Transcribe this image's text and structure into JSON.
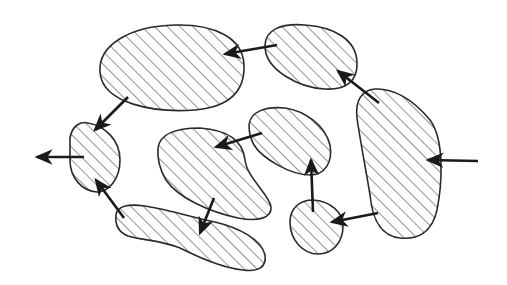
{
  "diagram": {
    "type": "hatched-regions-with-arrows",
    "background": "#ffffff",
    "stroke_color": "#2a2a2a",
    "hatch": {
      "direction": "diagonal-45",
      "spacing": 9,
      "color": "#3a3a3a"
    },
    "regions": [
      {
        "id": "top-left-large",
        "description": "large oval, top-left"
      },
      {
        "id": "top-right-small",
        "description": "small oval, top-right"
      },
      {
        "id": "left-small",
        "description": "small oval, left edge"
      },
      {
        "id": "center-left",
        "description": "bean shape, center-left"
      },
      {
        "id": "center-right",
        "description": "tilted oval, center"
      },
      {
        "id": "right-tall",
        "description": "tall elongated shape, right"
      },
      {
        "id": "bottom-elongated",
        "description": "long wavy shape, bottom"
      },
      {
        "id": "bottom-small-circle",
        "description": "small circle, bottom-center-right"
      }
    ],
    "arrows": [
      {
        "from": "top-right-small",
        "to": "top-left-large"
      },
      {
        "from": "top-left-large",
        "to": "left-small"
      },
      {
        "from": "left-small",
        "to": "outside-left"
      },
      {
        "from": "bottom-elongated",
        "to": "left-small"
      },
      {
        "from": "center-left",
        "to": "bottom-elongated"
      },
      {
        "from": "center-right",
        "to": "center-left"
      },
      {
        "from": "bottom-small-circle",
        "to": "center-right"
      },
      {
        "from": "right-tall",
        "to": "bottom-small-circle"
      },
      {
        "from": "right-tall",
        "to": "top-right-small"
      },
      {
        "from": "outside-right",
        "to": "right-tall"
      }
    ]
  }
}
